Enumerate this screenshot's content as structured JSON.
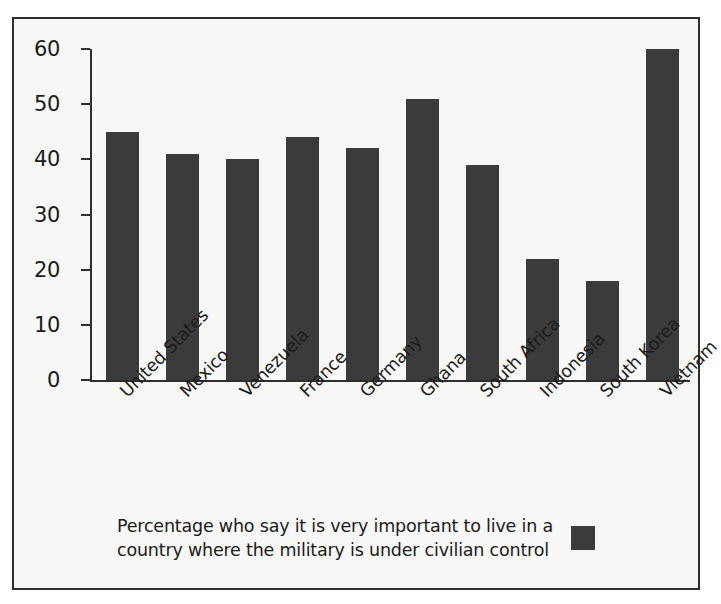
{
  "chart_data": {
    "type": "bar",
    "title": "",
    "subtitle": "",
    "xlabel": "",
    "ylabel": "",
    "ylim": [
      0,
      60
    ],
    "yticks": [
      0,
      10,
      20,
      30,
      40,
      50,
      60
    ],
    "grid": false,
    "legend_position": "bottom",
    "categories": [
      "United States",
      "Mexico",
      "Venezuela",
      "France",
      "Germany",
      "Ghana",
      "South Africa",
      "Indonesia",
      "South Korea",
      "Vietnam"
    ],
    "values": [
      45,
      41,
      40,
      44,
      42,
      51,
      39,
      22,
      18,
      60
    ],
    "series": [
      {
        "name": "Percentage who say it is very important to live in a country where the military is under civilian control",
        "values": [
          45,
          41,
          40,
          44,
          42,
          51,
          39,
          22,
          18,
          60
        ],
        "color": "#3b3b3b"
      }
    ]
  },
  "legend": {
    "label": "Percentage who say it is very important to live in a\ncountry where the military is under civilian control",
    "swatch_color": "#3b3b3b",
    "swatch_icon": "legend-square-icon"
  },
  "style": {
    "bar_color": "#3b3b3b",
    "axis_color": "#2e2e2e",
    "text_color": "#1b1b1b",
    "background": "#f7f7f5",
    "frame_border": "#2e2e2e"
  }
}
